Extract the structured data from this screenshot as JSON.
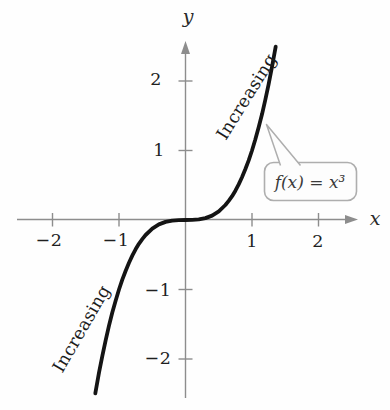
{
  "figure": {
    "background": "#fefefe",
    "axis_color": "#8d8d8d",
    "curve_color": "#141414",
    "text_color": "#1f1f1f",
    "callout_border_color": "#aeaeae",
    "callout_fill": "#fdfdfd"
  },
  "labels": {
    "y_axis": "y",
    "x_axis": "x",
    "increasing_upper": "Increasing",
    "increasing_lower": "Increasing",
    "formula": "f(x) = x³"
  },
  "chart_data": {
    "type": "line",
    "title": "",
    "function": "f(x) = x^3",
    "xlabel": "x",
    "ylabel": "y",
    "xlim": [
      -2.55,
      2.55
    ],
    "ylim": [
      -2.6,
      2.6
    ],
    "grid": false,
    "legend": false,
    "x_ticks": [
      -2,
      -1,
      1,
      2
    ],
    "x_tick_labels": [
      "−2",
      "−1",
      "1",
      "2"
    ],
    "y_ticks": [
      -2,
      -1,
      1,
      2
    ],
    "y_tick_labels": [
      "−2",
      "−1",
      "1",
      "2"
    ],
    "annotations": [
      "Increasing (x < 0 branch)",
      "Increasing (x > 0 branch)",
      "f(x) = x³ callout"
    ],
    "points": [
      [
        -1.356,
        -2.494
      ],
      [
        -1.3,
        -2.197
      ],
      [
        -1.25,
        -1.953
      ],
      [
        -1.2,
        -1.728
      ],
      [
        -1.15,
        -1.521
      ],
      [
        -1.1,
        -1.331
      ],
      [
        -1.05,
        -1.158
      ],
      [
        -1.0,
        -1.0
      ],
      [
        -0.95,
        -0.857
      ],
      [
        -0.9,
        -0.729
      ],
      [
        -0.85,
        -0.614
      ],
      [
        -0.8,
        -0.512
      ],
      [
        -0.75,
        -0.422
      ],
      [
        -0.7,
        -0.343
      ],
      [
        -0.65,
        -0.275
      ],
      [
        -0.6,
        -0.216
      ],
      [
        -0.5,
        -0.125
      ],
      [
        -0.4,
        -0.064
      ],
      [
        -0.3,
        -0.027
      ],
      [
        -0.2,
        -0.008
      ],
      [
        -0.1,
        -0.001
      ],
      [
        0,
        0
      ],
      [
        0.1,
        0.001
      ],
      [
        0.2,
        0.008
      ],
      [
        0.3,
        0.027
      ],
      [
        0.4,
        0.064
      ],
      [
        0.5,
        0.125
      ],
      [
        0.6,
        0.216
      ],
      [
        0.65,
        0.275
      ],
      [
        0.7,
        0.343
      ],
      [
        0.75,
        0.422
      ],
      [
        0.8,
        0.512
      ],
      [
        0.85,
        0.614
      ],
      [
        0.9,
        0.729
      ],
      [
        0.95,
        0.857
      ],
      [
        1.0,
        1.0
      ],
      [
        1.05,
        1.158
      ],
      [
        1.1,
        1.331
      ],
      [
        1.15,
        1.521
      ],
      [
        1.2,
        1.728
      ],
      [
        1.25,
        1.953
      ],
      [
        1.3,
        2.197
      ],
      [
        1.356,
        2.494
      ]
    ]
  }
}
